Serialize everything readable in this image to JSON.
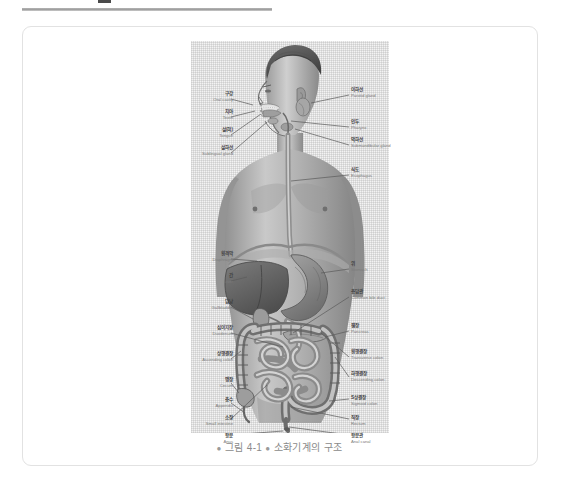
{
  "page": {
    "background_color": "#ffffff",
    "rule_color": "#a8a8a8",
    "card_border_color": "#e2e2e2"
  },
  "figure": {
    "caption_bullet": "●",
    "caption_number": "그림 4-1",
    "caption_title": "소화기계의 구조",
    "ink_color": "#6e6e6e",
    "labels_left": [
      {
        "ko": "구강",
        "en": "Oral cavity"
      },
      {
        "ko": "치아",
        "en": "Teeth"
      },
      {
        "ko": "설(혀)",
        "en": "Tongue"
      },
      {
        "ko": "설하선",
        "en": "Sublingual gland"
      },
      {
        "ko": "횡격막",
        "en": "Diaphragm"
      },
      {
        "ko": "간",
        "en": "Liver"
      },
      {
        "ko": "담낭",
        "en": "Gallbladder"
      },
      {
        "ko": "십이지장",
        "en": "Duodenum"
      },
      {
        "ko": "상행결장",
        "en": "Ascending colon"
      },
      {
        "ko": "맹장",
        "en": "Cecum"
      },
      {
        "ko": "충수",
        "en": "Appendix"
      },
      {
        "ko": "소장",
        "en": "Small intestine"
      },
      {
        "ko": "항문",
        "en": "Anus"
      }
    ],
    "labels_right": [
      {
        "ko": "이하선",
        "en": "Parotid gland"
      },
      {
        "ko": "인두",
        "en": "Pharynx"
      },
      {
        "ko": "악하선",
        "en": "Submandibular gland"
      },
      {
        "ko": "식도",
        "en": "Esophagus"
      },
      {
        "ko": "위",
        "en": "Stomach"
      },
      {
        "ko": "총담관",
        "en": "Common bile duct"
      },
      {
        "ko": "첌장",
        "en": "Pancreas"
      },
      {
        "ko": "횡행결장",
        "en": "Transverse colon"
      },
      {
        "ko": "하행결장",
        "en": "Descending colon"
      },
      {
        "ko": "S상결장",
        "en": "Sigmoid colon"
      },
      {
        "ko": "직장",
        "en": "Rectum"
      },
      {
        "ko": "항문관",
        "en": "Anal canal"
      }
    ]
  }
}
